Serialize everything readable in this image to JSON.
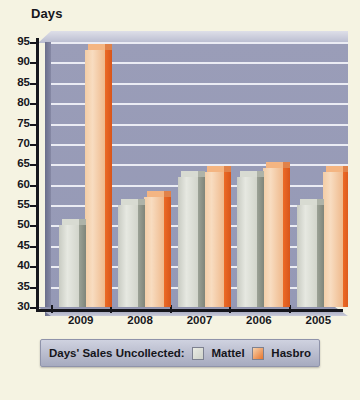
{
  "chart_data": {
    "type": "bar",
    "title": "",
    "ylabel": "Days",
    "xlabel": "",
    "categories": [
      "2009",
      "2008",
      "2007",
      "2006",
      "2005"
    ],
    "series": [
      {
        "name": "Mattel",
        "color": "#d8dbd2",
        "values": [
          50,
          55,
          62,
          62,
          55
        ]
      },
      {
        "name": "Hasbro",
        "color": "#e8762e",
        "values": [
          93,
          57,
          63,
          64,
          63
        ]
      }
    ],
    "ylim": [
      30,
      95
    ],
    "ytick_step": 5,
    "yticks": [
      30,
      35,
      40,
      45,
      50,
      55,
      60,
      65,
      70,
      75,
      80,
      85,
      90,
      95
    ],
    "grid": true,
    "legend_position": "bottom",
    "legend_title": "Days' Sales Uncollected:",
    "plot_background": "#9a9db8",
    "gridline_color": "#f2f3f8",
    "page_background": "#f5f3e2"
  },
  "legend": {
    "title": "Days' Sales Uncollected:",
    "entries": [
      {
        "label": "Mattel",
        "swatch": "mattel-swatch-icon"
      },
      {
        "label": "Hasbro",
        "swatch": "hasbro-swatch-icon"
      }
    ]
  }
}
